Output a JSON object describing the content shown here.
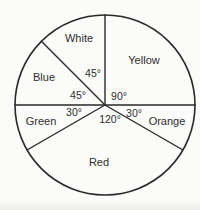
{
  "figure": {
    "background": "#fbfbfa",
    "line_color": "#2a2a2a",
    "text_color": "#2e2e2e"
  },
  "chart_data": {
    "type": "pie",
    "title": "",
    "style": "unfilled outline pie chart, black strokes on white, labels inside sectors, central angle values printed near center",
    "direction": "clockwise",
    "start": "12 o'clock",
    "total_degrees": 360,
    "grid": false,
    "legend_position": "none",
    "categories": [
      "Yellow",
      "Orange",
      "Red",
      "Green",
      "Blue",
      "White"
    ],
    "values": [
      90,
      30,
      120,
      30,
      45,
      45
    ],
    "sectors": [
      {
        "name": "Yellow",
        "value_deg": 90,
        "angle_label": "90°",
        "name_pos": [
          144,
          60
        ],
        "angle_label_pos": [
          119,
          96
        ]
      },
      {
        "name": "Orange",
        "value_deg": 30,
        "angle_label": "30°",
        "name_pos": [
          167,
          121
        ],
        "angle_label_pos": [
          134,
          113
        ]
      },
      {
        "name": "Red",
        "value_deg": 120,
        "angle_label": "120°",
        "name_pos": [
          99,
          162
        ],
        "angle_label_pos": [
          110,
          119
        ]
      },
      {
        "name": "Green",
        "value_deg": 30,
        "angle_label": "30°",
        "name_pos": [
          41,
          121
        ],
        "angle_label_pos": [
          74,
          112
        ]
      },
      {
        "name": "Blue",
        "value_deg": 45,
        "angle_label": "45°",
        "name_pos": [
          44,
          77
        ],
        "angle_label_pos": [
          78,
          95
        ]
      },
      {
        "name": "White",
        "value_deg": 45,
        "angle_label": "45°",
        "name_pos": [
          79,
          38
        ],
        "angle_label_pos": [
          93,
          73
        ]
      }
    ],
    "layout": {
      "cx": 105,
      "cy": 105,
      "r": 90,
      "width": 200,
      "height": 210,
      "circle_stroke_width": 1.6,
      "radius_stroke_width": 1.4
    }
  }
}
